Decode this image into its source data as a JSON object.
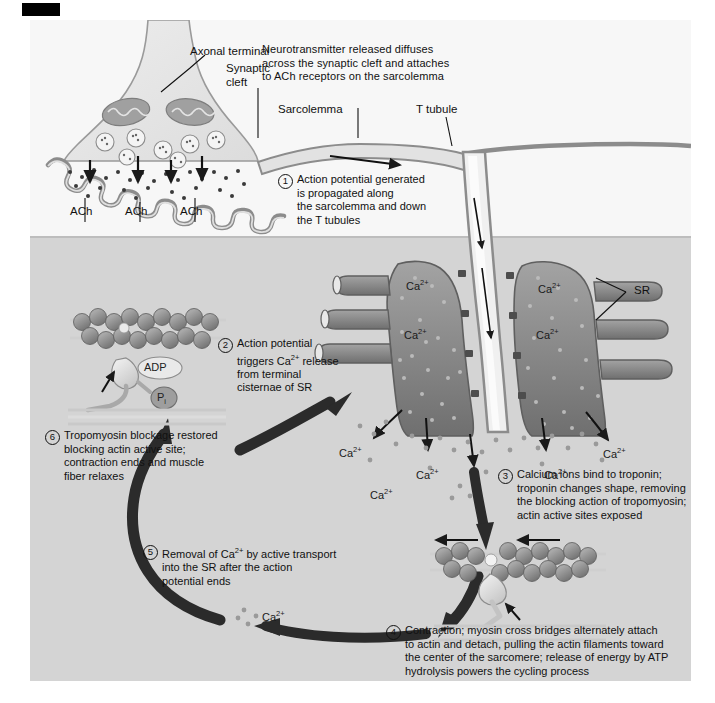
{
  "figure": {
    "corner_marker": "",
    "background_upper": "#f7f7f7",
    "background_lower": "#d4d4d4",
    "panel_background": "#f2f2f2"
  },
  "intro_text": "Neurotransmitter released diffuses\nacross the synaptic cleft and attaches\nto ACh receptors on the sarcolemma",
  "labels": {
    "axonal_terminal": "Axonal terminal",
    "synaptic_cleft": "Synaptic\ncleft",
    "sarcolemma": "Sarcolemma",
    "t_tubule": "T tubule",
    "sr": "SR",
    "ach_1": "ACh",
    "ach_2": "ACh",
    "ach_3": "ACh",
    "adp": "ADP",
    "pi": "P",
    "pi_sub": "i"
  },
  "ions": {
    "label": "Ca",
    "charge": "2+",
    "positions_note": "Ca2+ labels scattered in SR and cytosol",
    "count": 9
  },
  "steps": [
    {
      "number": "1",
      "text": "Action potential generated\nis propagated along\nthe sarcolemma and down\nthe T tubules"
    },
    {
      "number": "2",
      "text": "Action potential\ntriggers Ca2+ release\nfrom terminal\ncisternae of SR"
    },
    {
      "number": "3",
      "text": "Calcium ions bind to troponin;\ntroponin changes shape, removing\nthe blocking action of tropomyosin;\nactin active sites exposed"
    },
    {
      "number": "4",
      "text": "Contraction; myosin cross bridges alternately attach\nto actin and detach, pulling the actin filaments toward\nthe center of the sarcomere; release of energy by ATP\nhydrolysis powers the cycling process"
    },
    {
      "number": "5",
      "text": "Removal of Ca2+ by active transport\ninto the SR after the action\npotential ends"
    },
    {
      "number": "6",
      "text": "Tropomyosin blockage restored\nblocking actin active site;\ncontraction ends and muscle\nfiber relaxes"
    }
  ],
  "colors": {
    "sr_fill": "#8a8a8a",
    "outline": "#6b6b6b",
    "arrow_black": "#1a1a1a",
    "actin_bead": "#8c8c8c",
    "myosin_head": "#d8d8d8"
  }
}
